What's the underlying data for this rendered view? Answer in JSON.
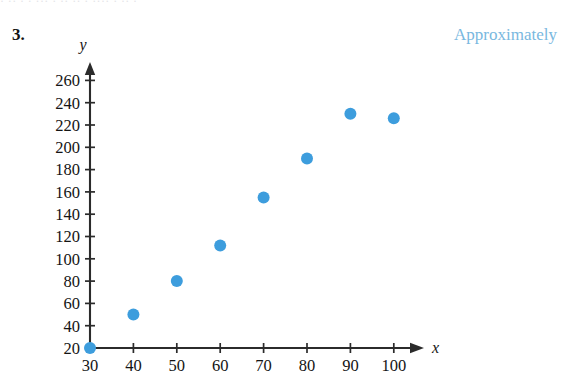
{
  "page": {
    "problem_number": "3.",
    "caption_right": "Approximately",
    "caption_right_color": "#79b8e0",
    "background_color": "#ffffff",
    "top_bleed_text": "· ··   · ·  ··· · ··  ·· · ···· · ·· ·"
  },
  "chart_data": {
    "type": "scatter",
    "title": "",
    "xlabel": "x",
    "ylabel": "y",
    "x": [
      30,
      40,
      50,
      60,
      70,
      80,
      90,
      100
    ],
    "values": [
      20,
      50,
      80,
      112,
      155,
      190,
      230,
      226
    ],
    "points": [
      {
        "x": 30,
        "y": 20
      },
      {
        "x": 40,
        "y": 50
      },
      {
        "x": 50,
        "y": 80
      },
      {
        "x": 60,
        "y": 112
      },
      {
        "x": 70,
        "y": 155
      },
      {
        "x": 80,
        "y": 190
      },
      {
        "x": 90,
        "y": 230
      },
      {
        "x": 100,
        "y": 226
      }
    ],
    "xlim": [
      30,
      100
    ],
    "ylim": [
      20,
      260
    ],
    "xticks": [
      30,
      40,
      50,
      60,
      70,
      80,
      90,
      100
    ],
    "yticks": [
      20,
      40,
      60,
      80,
      100,
      120,
      140,
      160,
      180,
      200,
      220,
      240,
      260
    ],
    "xtick_labels": [
      "30",
      "40",
      "50",
      "60",
      "70",
      "80",
      "90",
      "100"
    ],
    "ytick_labels": [
      "20",
      "40",
      "60",
      "80",
      "100",
      "120",
      "140",
      "160",
      "180",
      "200",
      "220",
      "240",
      "260"
    ],
    "grid": false,
    "legend": null,
    "marker_color": "#3d9ddd",
    "marker_radius": 6,
    "axis_color": "#2b2b2b",
    "axis_style": "arrow-tipped L-axes"
  },
  "geometry": {
    "origin_px": {
      "x": 90,
      "y": 348
    },
    "x_px_per_unit": 4.34,
    "y_px_per_unit": 1.115,
    "x_axis_end_px": 424,
    "y_axis_top_px": 62
  }
}
